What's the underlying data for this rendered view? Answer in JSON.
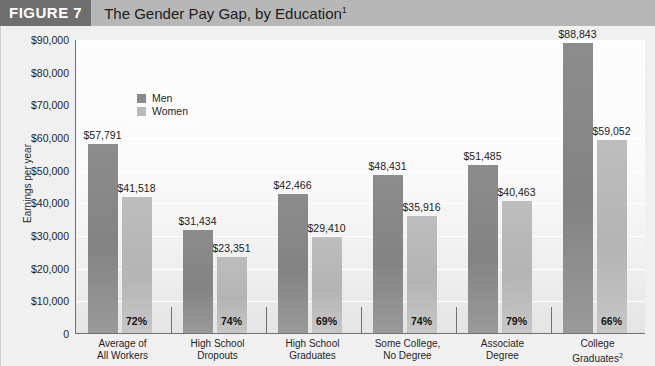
{
  "header": {
    "figure_tag": "FIGURE 7",
    "title": "The Gender Pay Gap, by Education",
    "title_superscript": "1"
  },
  "legend": {
    "position": "inside-top-left",
    "items": [
      {
        "label": "Men",
        "color": "#8a8a8a"
      },
      {
        "label": "Women",
        "color": "#bababa"
      }
    ]
  },
  "chart_data": {
    "type": "bar",
    "title": "The Gender Pay Gap, by Education",
    "xlabel": "",
    "ylabel": "Earnings per year",
    "ylim": [
      0,
      90000
    ],
    "ytick_labels": [
      "$90,000",
      "$80,000",
      "$70,000",
      "$60,000",
      "$50,000",
      "$40,000",
      "$30,000",
      "$20,000",
      "$10,000",
      "0"
    ],
    "ytick_values": [
      90000,
      80000,
      70000,
      60000,
      50000,
      40000,
      30000,
      20000,
      10000,
      0
    ],
    "grid": true,
    "grid_color": "#ffffff",
    "legend_position": "upper left inside",
    "categories": [
      "Average of\nAll Workers",
      "High School\nDropouts",
      "High School\nGraduates",
      "Some College,\nNo Degree",
      "Associate\nDegree",
      "College\nGraduates"
    ],
    "category_lines": [
      [
        "Average of",
        "All Workers"
      ],
      [
        "High School",
        "Dropouts"
      ],
      [
        "High School",
        "Graduates"
      ],
      [
        "Some College,",
        "No Degree"
      ],
      [
        "Associate",
        "Degree"
      ],
      [
        "College",
        "Graduates"
      ]
    ],
    "category_superscripts": [
      "",
      "",
      "",
      "",
      "",
      "2"
    ],
    "series": [
      {
        "name": "Men",
        "color": "#8a8a8a",
        "values": [
          57791,
          31434,
          42466,
          48431,
          51485,
          88843
        ],
        "value_labels": [
          "$57,791",
          "$31,434",
          "$42,466",
          "$48,431",
          "$51,485",
          "$88,843"
        ]
      },
      {
        "name": "Women",
        "color": "#bababa",
        "values": [
          41518,
          23351,
          29410,
          35916,
          40463,
          59052
        ],
        "value_labels": [
          "$41,518",
          "$23,351",
          "$29,410",
          "$35,916",
          "$40,463",
          "$59,052"
        ]
      }
    ],
    "ratio_labels": [
      "72%",
      "74%",
      "69%",
      "74%",
      "79%",
      "66%"
    ]
  }
}
